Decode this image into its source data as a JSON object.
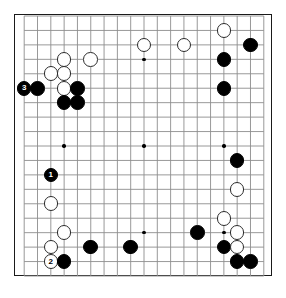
{
  "board": {
    "name": "go-board-diagram",
    "size": 19,
    "grid_color": "#8d8d8d",
    "border_color": "#1a1a1a",
    "background_color": "#ffffff",
    "black_color": "#000000",
    "white_color": "#ffffff",
    "star_points": [
      {
        "col": 4,
        "row": 4
      },
      {
        "col": 10,
        "row": 4
      },
      {
        "col": 16,
        "row": 4
      },
      {
        "col": 4,
        "row": 10
      },
      {
        "col": 10,
        "row": 10
      },
      {
        "col": 16,
        "row": 10
      },
      {
        "col": 4,
        "row": 16
      },
      {
        "col": 10,
        "row": 16
      },
      {
        "col": 16,
        "row": 16
      }
    ],
    "stones": [
      {
        "color": "white",
        "col": 16,
        "row": 2,
        "label": ""
      },
      {
        "color": "black",
        "col": 18,
        "row": 3,
        "label": ""
      },
      {
        "color": "white",
        "col": 10,
        "row": 3,
        "label": ""
      },
      {
        "color": "white",
        "col": 13,
        "row": 3,
        "label": ""
      },
      {
        "color": "black",
        "col": 16,
        "row": 4,
        "label": ""
      },
      {
        "color": "white",
        "col": 4,
        "row": 4,
        "label": ""
      },
      {
        "color": "white",
        "col": 6,
        "row": 4,
        "label": ""
      },
      {
        "color": "white",
        "col": 3,
        "row": 5,
        "label": ""
      },
      {
        "color": "white",
        "col": 4,
        "row": 5,
        "label": ""
      },
      {
        "color": "black",
        "col": 1,
        "row": 6,
        "label": "3"
      },
      {
        "color": "black",
        "col": 2,
        "row": 6,
        "label": ""
      },
      {
        "color": "white",
        "col": 4,
        "row": 6,
        "label": ""
      },
      {
        "color": "black",
        "col": 5,
        "row": 6,
        "label": ""
      },
      {
        "color": "black",
        "col": 16,
        "row": 6,
        "label": ""
      },
      {
        "color": "black",
        "col": 4,
        "row": 7,
        "label": ""
      },
      {
        "color": "black",
        "col": 5,
        "row": 7,
        "label": ""
      },
      {
        "color": "black",
        "col": 17,
        "row": 11,
        "label": ""
      },
      {
        "color": "black",
        "col": 3,
        "row": 12,
        "label": "1"
      },
      {
        "color": "white",
        "col": 17,
        "row": 13,
        "label": ""
      },
      {
        "color": "white",
        "col": 3,
        "row": 14,
        "label": ""
      },
      {
        "color": "white",
        "col": 16,
        "row": 15,
        "label": ""
      },
      {
        "color": "white",
        "col": 4,
        "row": 16,
        "label": ""
      },
      {
        "color": "black",
        "col": 14,
        "row": 16,
        "label": ""
      },
      {
        "color": "white",
        "col": 17,
        "row": 16,
        "label": ""
      },
      {
        "color": "white",
        "col": 3,
        "row": 17,
        "label": ""
      },
      {
        "color": "black",
        "col": 6,
        "row": 17,
        "label": ""
      },
      {
        "color": "black",
        "col": 9,
        "row": 17,
        "label": ""
      },
      {
        "color": "black",
        "col": 16,
        "row": 17,
        "label": ""
      },
      {
        "color": "white",
        "col": 17,
        "row": 17,
        "label": ""
      },
      {
        "color": "white",
        "col": 3,
        "row": 18,
        "label": "2"
      },
      {
        "color": "black",
        "col": 4,
        "row": 18,
        "label": ""
      },
      {
        "color": "black",
        "col": 17,
        "row": 18,
        "label": ""
      },
      {
        "color": "black",
        "col": 18,
        "row": 18,
        "label": ""
      }
    ],
    "move_labels": [
      "1",
      "2",
      "3"
    ]
  }
}
